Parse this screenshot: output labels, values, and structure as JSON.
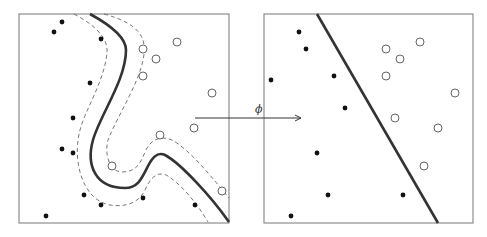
{
  "figure": {
    "arrow_label": "ϕ",
    "colors": {
      "frame": "#777777",
      "boundary": "#333333",
      "margin": "#666666",
      "point_fill": "#111111",
      "open_point_stroke": "#555555"
    }
  },
  "left_panel": {
    "name": "input-space",
    "frame": {
      "x": 19,
      "y": 14,
      "w": 210,
      "h": 209
    },
    "filled_points": [
      [
        62,
        22
      ],
      [
        54,
        32
      ],
      [
        101,
        39
      ],
      [
        90,
        83
      ],
      [
        73,
        118
      ],
      [
        62,
        149
      ],
      [
        73,
        153
      ],
      [
        84,
        195
      ],
      [
        101,
        205
      ],
      [
        143,
        198
      ],
      [
        195,
        205
      ],
      [
        46,
        216
      ]
    ],
    "open_points": [
      [
        143,
        49
      ],
      [
        177,
        42
      ],
      [
        156,
        59
      ],
      [
        143,
        76
      ],
      [
        212,
        93
      ],
      [
        160,
        135
      ],
      [
        194,
        128
      ],
      [
        112,
        166
      ],
      [
        222,
        191
      ]
    ]
  },
  "right_panel": {
    "name": "feature-space",
    "frame": {
      "x": 264,
      "y": 14,
      "w": 209,
      "h": 209
    },
    "filled_points": [
      [
        299,
        32
      ],
      [
        306,
        49
      ],
      [
        271,
        80
      ],
      [
        334,
        76
      ],
      [
        345,
        108
      ],
      [
        317,
        153
      ],
      [
        328,
        195
      ],
      [
        403,
        195
      ],
      [
        291,
        216
      ]
    ],
    "open_points": [
      [
        386,
        49
      ],
      [
        420,
        42
      ],
      [
        400,
        59
      ],
      [
        386,
        76
      ],
      [
        455,
        93
      ],
      [
        395,
        118
      ],
      [
        438,
        128
      ],
      [
        424,
        166
      ]
    ],
    "boundary": {
      "x1": 317,
      "y1": 14,
      "x2": 438,
      "y2": 223
    }
  },
  "arrow": {
    "x1": 195,
    "y1": 118,
    "x2": 300,
    "y2": 118,
    "label_x": 257,
    "label_y": 104
  }
}
